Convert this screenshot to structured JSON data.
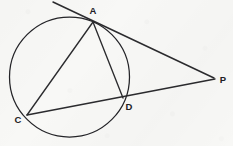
{
  "figure": {
    "kind": "geometry-diagram",
    "canvas": {
      "width": 233,
      "height": 146
    },
    "colors": {
      "background": "#f8f8f6",
      "ink": "#2b2b2e",
      "circle_stroke": "#242428",
      "label_fill": "#202024"
    }
  },
  "circle": {
    "name": "main-circle",
    "center_x": 69.5,
    "center_y": 77,
    "radius": 60
  },
  "points": [
    {
      "id": "A",
      "label": "A",
      "x": 93,
      "y": 22,
      "label_x": 93,
      "label_y": 14,
      "on_circle": true
    },
    {
      "id": "C",
      "label": "C",
      "x": 27,
      "y": 115,
      "label_x": 18,
      "label_y": 123,
      "on_circle": true
    },
    {
      "id": "D",
      "label": "D",
      "x": 123,
      "y": 98,
      "label_x": 129,
      "label_y": 110,
      "on_circle": true
    },
    {
      "id": "P",
      "label": "P",
      "x": 215,
      "y": 79,
      "label_x": 223,
      "label_y": 83,
      "on_circle": false
    }
  ],
  "segments": [
    {
      "id": "tangent-at-A",
      "label": "tangent line through A",
      "x1": 53,
      "y1": 2,
      "x2": 214,
      "y2": 78,
      "style": "tangent-line"
    },
    {
      "id": "secant-CDP",
      "label": "secant C through D to P",
      "x1": 27,
      "y1": 115,
      "x2": 215,
      "y2": 79,
      "style": "secant-line"
    },
    {
      "id": "chord-AC",
      "label": "chord A to C",
      "x1": 93,
      "y1": 22,
      "x2": 27,
      "y2": 115,
      "style": "chord-line"
    },
    {
      "id": "chord-AD",
      "label": "chord A to D",
      "x1": 93,
      "y1": 22,
      "x2": 123,
      "y2": 98,
      "style": "chord-line"
    }
  ]
}
